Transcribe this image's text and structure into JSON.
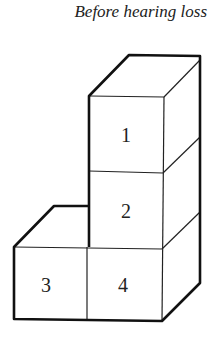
{
  "title": "Before hearing loss",
  "blocks": [
    {
      "label": "1"
    },
    {
      "label": "2"
    },
    {
      "label": "3"
    },
    {
      "label": "4"
    }
  ]
}
